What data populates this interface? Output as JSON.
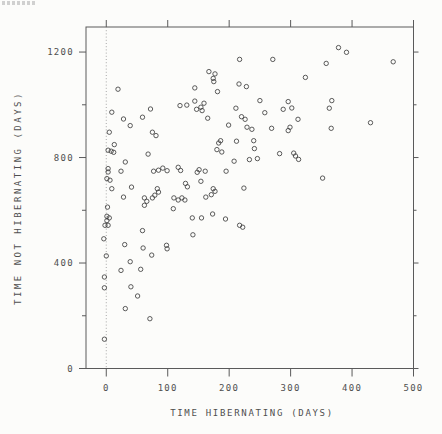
{
  "style": {
    "background": "#fcfcfa",
    "frame_color": "#5a5a5a",
    "marker_color": "#3f3f3f",
    "text_color": "#4f4f4f",
    "dotted_line_color": "#9e9e9e"
  },
  "chart_data": {
    "type": "scatter",
    "title": "",
    "xlabel": "TIME HIBERNATING (DAYS)",
    "ylabel": "TIME NOT HIBERNATING (DAYS)",
    "xlim": [
      -33,
      500
    ],
    "ylim": [
      0,
      1295
    ],
    "x_ticks": [
      0,
      100,
      200,
      300,
      400,
      500
    ],
    "y_ticks": [
      0,
      400,
      800,
      1200
    ],
    "y_minor_ticks": [
      200,
      600,
      1000
    ],
    "reference_line_x": 0,
    "marker": "open-circle",
    "grid": false,
    "legend": "none",
    "points": [
      [
        19,
        1059
      ],
      [
        9,
        972
      ],
      [
        28,
        946
      ],
      [
        39,
        921
      ],
      [
        59,
        953
      ],
      [
        72,
        984
      ],
      [
        75,
        896
      ],
      [
        81,
        883
      ],
      [
        120,
        997
      ],
      [
        131,
        999
      ],
      [
        144,
        1064
      ],
      [
        5,
        896
      ],
      [
        167,
        1126
      ],
      [
        177,
        1117
      ],
      [
        174,
        1100
      ],
      [
        175,
        1088
      ],
      [
        217,
        1172
      ],
      [
        271,
        1172
      ],
      [
        216,
        1079
      ],
      [
        228,
        1069
      ],
      [
        181,
        1050
      ],
      [
        144,
        1014
      ],
      [
        159,
        1006
      ],
      [
        154,
        991
      ],
      [
        147,
        983
      ],
      [
        156,
        978
      ],
      [
        165,
        949
      ],
      [
        211,
        987
      ],
      [
        250,
        1016
      ],
      [
        258,
        970
      ],
      [
        220,
        955
      ],
      [
        226,
        945
      ],
      [
        229,
        915
      ],
      [
        237,
        907
      ],
      [
        199,
        923
      ],
      [
        269,
        911
      ],
      [
        288,
        983
      ],
      [
        296,
        1012
      ],
      [
        302,
        988
      ],
      [
        312,
        945
      ],
      [
        299,
        915
      ],
      [
        296,
        902
      ],
      [
        240,
        864
      ],
      [
        378,
        1217
      ],
      [
        391,
        1199
      ],
      [
        358,
        1157
      ],
      [
        467,
        1163
      ],
      [
        324,
        1104
      ],
      [
        367,
        1016
      ],
      [
        363,
        987
      ],
      [
        430,
        932
      ],
      [
        366,
        911
      ],
      [
        13,
        849
      ],
      [
        3,
        828
      ],
      [
        8,
        824
      ],
      [
        12,
        820
      ],
      [
        31,
        783
      ],
      [
        68,
        813
      ],
      [
        3,
        758
      ],
      [
        3,
        745
      ],
      [
        24,
        748
      ],
      [
        1,
        720
      ],
      [
        6,
        714
      ],
      [
        77,
        748
      ],
      [
        85,
        752
      ],
      [
        92,
        760
      ],
      [
        99,
        750
      ],
      [
        117,
        763
      ],
      [
        121,
        751
      ],
      [
        9,
        682
      ],
      [
        41,
        688
      ],
      [
        28,
        650
      ],
      [
        83,
        682
      ],
      [
        85,
        669
      ],
      [
        79,
        657
      ],
      [
        75,
        647
      ],
      [
        62,
        647
      ],
      [
        66,
        634
      ],
      [
        62,
        619
      ],
      [
        2,
        612
      ],
      [
        1,
        577
      ],
      [
        5,
        571
      ],
      [
        1,
        561
      ],
      [
        -2,
        543
      ],
      [
        3,
        543
      ],
      [
        59,
        523
      ],
      [
        -4,
        492
      ],
      [
        30,
        470
      ],
      [
        60,
        457
      ],
      [
        74,
        430
      ],
      [
        98,
        467
      ],
      [
        99,
        454
      ],
      [
        129,
        702
      ],
      [
        132,
        689
      ],
      [
        123,
        647
      ],
      [
        128,
        639
      ],
      [
        110,
        647
      ],
      [
        117,
        639
      ],
      [
        109,
        606
      ],
      [
        140,
        571
      ],
      [
        141,
        507
      ],
      [
        186,
        864
      ],
      [
        183,
        855
      ],
      [
        212,
        862
      ],
      [
        180,
        830
      ],
      [
        188,
        821
      ],
      [
        241,
        834
      ],
      [
        208,
        786
      ],
      [
        233,
        792
      ],
      [
        246,
        796
      ],
      [
        282,
        815
      ],
      [
        305,
        817
      ],
      [
        308,
        806
      ],
      [
        313,
        793
      ],
      [
        151,
        754
      ],
      [
        148,
        744
      ],
      [
        161,
        748
      ],
      [
        195,
        748
      ],
      [
        154,
        710
      ],
      [
        174,
        682
      ],
      [
        177,
        672
      ],
      [
        162,
        650
      ],
      [
        171,
        659
      ],
      [
        224,
        684
      ],
      [
        173,
        586
      ],
      [
        155,
        571
      ],
      [
        194,
        567
      ],
      [
        217,
        543
      ],
      [
        222,
        536
      ],
      [
        352,
        722
      ],
      [
        0,
        427
      ],
      [
        39,
        405
      ],
      [
        24,
        372
      ],
      [
        56,
        376
      ],
      [
        -3,
        347
      ],
      [
        -3,
        306
      ],
      [
        40,
        310
      ],
      [
        51,
        275
      ],
      [
        31,
        227
      ],
      [
        71,
        189
      ],
      [
        -3,
        111
      ]
    ]
  }
}
